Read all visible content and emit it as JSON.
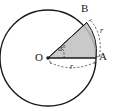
{
  "figure": {
    "type": "geometry-diagram",
    "background_color": "#ffffff",
    "stroke_color": "#1a1a1a",
    "sector_fill_color": "#bfbfbf",
    "dash_color": "#555555"
  },
  "labels": {
    "center_point": "O",
    "point_a": "A",
    "point_b": "B",
    "radius_label": "r",
    "arc_label": "r",
    "angle_label": "α°"
  },
  "geometry": {
    "circle": {
      "cx": 48,
      "cy": 58,
      "r": 48
    },
    "point_o": {
      "x": 48,
      "y": 58
    },
    "point_a": {
      "x": 96,
      "y": 58
    },
    "point_b": {
      "x": 86.8,
      "y": 22.5
    },
    "central_angle_degrees": 57.3
  }
}
